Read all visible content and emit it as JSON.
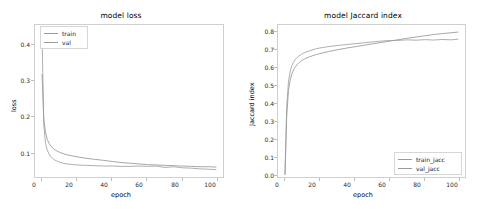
{
  "figure": {
    "width": 484,
    "height": 209,
    "background": "#ffffff",
    "line_color": "#8f8f8f",
    "axis_color": "#cfcfcf"
  },
  "panels": [
    {
      "name": "model-loss",
      "title": "model loss",
      "xlabel": "epoch",
      "ylabel": "loss",
      "xticks": [
        "0",
        "20",
        "40",
        "60",
        "80",
        "100"
      ],
      "yticks": [
        "0.1",
        "0.2",
        "0.3",
        "0.4"
      ],
      "legend": [
        {
          "label": "train",
          "color": "#8f8f8f"
        },
        {
          "label": "val",
          "color": "#9a9a9a"
        }
      ]
    },
    {
      "name": "model-jaccard-index",
      "title": "model Jaccard index",
      "xlabel": "epoch",
      "ylabel": "Jaccard index",
      "xticks": [
        "0",
        "20",
        "40",
        "60",
        "80",
        "100"
      ],
      "yticks": [
        "0.0",
        "0.1",
        "0.2",
        "0.3",
        "0.4",
        "0.5",
        "0.6",
        "0.7",
        "0.8"
      ],
      "legend": [
        {
          "label": "train_jacc",
          "color": "#8f8f8f"
        },
        {
          "label": "val_jacc",
          "color": "#9a9a9a"
        }
      ]
    }
  ],
  "chart_data": [
    {
      "type": "line",
      "title": "model loss",
      "xlabel": "epoch",
      "ylabel": "loss",
      "xlim": [
        -4,
        103
      ],
      "ylim": [
        0.022,
        0.452
      ],
      "grid": false,
      "legend_position": "upper left",
      "x": [
        0,
        1,
        2,
        3,
        4,
        5,
        6,
        7,
        8,
        9,
        10,
        12,
        14,
        16,
        18,
        20,
        25,
        30,
        35,
        40,
        45,
        50,
        55,
        60,
        65,
        70,
        75,
        80,
        85,
        90,
        95,
        99
      ],
      "series": [
        {
          "name": "train",
          "values": [
            0.312,
            0.186,
            0.148,
            0.128,
            0.117,
            0.11,
            0.104,
            0.1,
            0.097,
            0.094,
            0.092,
            0.088,
            0.085,
            0.083,
            0.081,
            0.079,
            0.075,
            0.072,
            0.069,
            0.066,
            0.063,
            0.061,
            0.059,
            0.057,
            0.056,
            0.055,
            0.054,
            0.053,
            0.052,
            0.051,
            0.051,
            0.05
          ]
        },
        {
          "name": "val",
          "values": [
            0.43,
            0.168,
            0.117,
            0.098,
            0.087,
            0.08,
            0.075,
            0.071,
            0.068,
            0.066,
            0.064,
            0.061,
            0.059,
            0.058,
            0.057,
            0.056,
            0.055,
            0.054,
            0.053,
            0.053,
            0.052,
            0.052,
            0.053,
            0.052,
            0.053,
            0.049,
            0.051,
            0.048,
            0.047,
            0.045,
            0.044,
            0.043
          ]
        }
      ]
    },
    {
      "type": "line",
      "title": "model Jaccard index",
      "xlabel": "epoch",
      "ylabel": "Jaccard index",
      "xlim": [
        -4,
        103
      ],
      "ylim": [
        -0.02,
        0.84
      ],
      "grid": false,
      "legend_position": "lower right",
      "x": [
        0,
        1,
        2,
        3,
        4,
        5,
        6,
        7,
        8,
        9,
        10,
        12,
        14,
        16,
        18,
        20,
        25,
        30,
        35,
        40,
        45,
        50,
        55,
        60,
        65,
        70,
        75,
        80,
        85,
        90,
        95,
        99
      ],
      "series": [
        {
          "name": "train_jacc",
          "values": [
            -0.005,
            0.33,
            0.47,
            0.53,
            0.565,
            0.588,
            0.604,
            0.616,
            0.626,
            0.634,
            0.641,
            0.652,
            0.66,
            0.667,
            0.673,
            0.678,
            0.69,
            0.7,
            0.709,
            0.717,
            0.725,
            0.733,
            0.741,
            0.749,
            0.757,
            0.765,
            0.772,
            0.779,
            0.786,
            0.791,
            0.796,
            0.8
          ]
        },
        {
          "name": "val_jacc",
          "values": [
            -0.005,
            0.38,
            0.52,
            0.58,
            0.612,
            0.632,
            0.646,
            0.657,
            0.665,
            0.672,
            0.678,
            0.687,
            0.694,
            0.7,
            0.706,
            0.71,
            0.718,
            0.724,
            0.729,
            0.734,
            0.739,
            0.744,
            0.749,
            0.752,
            0.753,
            0.756,
            0.754,
            0.757,
            0.755,
            0.758,
            0.756,
            0.76
          ]
        }
      ]
    }
  ]
}
